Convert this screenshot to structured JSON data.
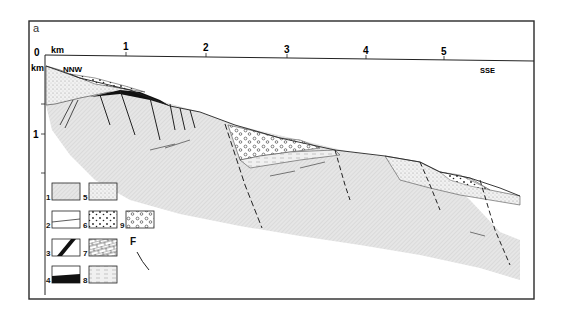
{
  "panel_label": "a",
  "axis": {
    "top_unit": "km",
    "left_unit": "km",
    "top_ticks": [
      "0",
      "1",
      "2",
      "3",
      "4",
      "5"
    ],
    "left_ticks": [
      "1"
    ]
  },
  "orientation": {
    "left": "NNW",
    "right": "SSE"
  },
  "legend": {
    "items": [
      {
        "id": "1",
        "label": "1"
      },
      {
        "id": "2",
        "label": "2"
      },
      {
        "id": "3",
        "label": "3"
      },
      {
        "id": "4",
        "label": "4"
      },
      {
        "id": "5",
        "label": "5"
      },
      {
        "id": "6",
        "label": "6"
      },
      {
        "id": "7",
        "label": "7"
      },
      {
        "id": "8",
        "label": "8"
      },
      {
        "id": "9",
        "label": "9"
      }
    ],
    "fault_symbol_label": "F"
  },
  "colors": {
    "frame": "#2a2a2a",
    "ink": "#1a1a1a",
    "basement_fill": "#dcdcdc",
    "light_fill": "#ececec"
  }
}
